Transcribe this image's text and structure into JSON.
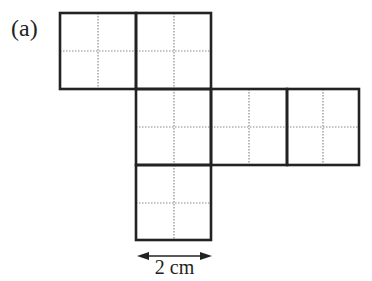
{
  "figure": {
    "panel_label": "(a)",
    "squares": [
      {
        "row": 0,
        "col": 0
      },
      {
        "row": 0,
        "col": 1
      },
      {
        "row": 1,
        "col": 1
      },
      {
        "row": 1,
        "col": 2
      },
      {
        "row": 1,
        "col": 3
      },
      {
        "row": 2,
        "col": 1
      }
    ],
    "square_side_label": "2 cm",
    "colors": {
      "solid_line": "#222222",
      "dotted_line": "#8a8a8a",
      "background": "#ffffff"
    }
  }
}
